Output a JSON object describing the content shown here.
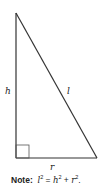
{
  "diagram": {
    "type": "right-triangle",
    "vertices": {
      "apex": [
        16,
        13
      ],
      "right_angle": [
        16,
        158
      ],
      "base_end": [
        97,
        158
      ]
    },
    "labels": {
      "height": "h",
      "hypotenuse": "l",
      "base": "r"
    },
    "stroke_color": "#333333"
  },
  "note": {
    "prefix": "Note:",
    "l": "l",
    "h": "h",
    "r": "r",
    "exp": "2",
    "eq": " = ",
    "plus": " + ",
    "end": "."
  }
}
